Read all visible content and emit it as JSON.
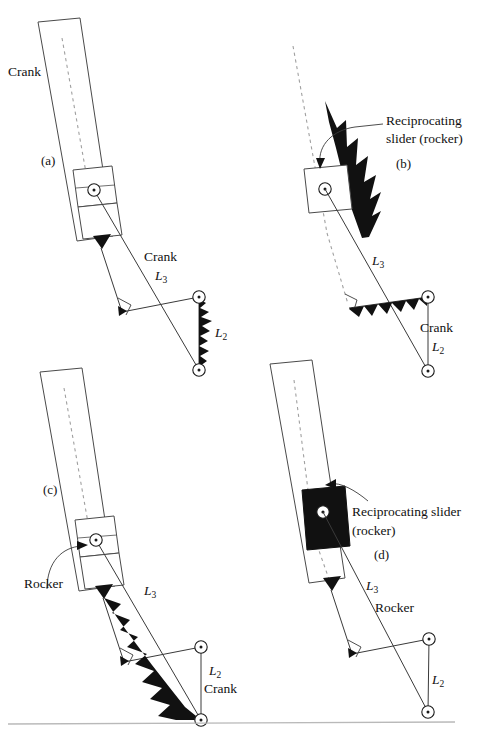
{
  "figure": {
    "type": "mechanism-inversion-diagram",
    "panel_count": 4,
    "divider_present": true,
    "colors": {
      "line": "#1a1a1a",
      "ground_hatch": "#111111",
      "dashed_axis": "#9a9a9a",
      "background": "#ffffff"
    }
  },
  "panels": [
    {
      "id": "a",
      "tag": "(a)",
      "labels": {
        "rocker_bar": "Crank",
        "coupler_name": "Crank",
        "coupler_length": "L",
        "coupler_sub": "3",
        "crank_length": "L",
        "crank_sub": "2"
      },
      "slider_fill": "white",
      "bar_outline": true
    },
    {
      "id": "b",
      "tag": "(b)",
      "labels": {
        "callout_line1": "Reciprocating",
        "callout_line2": "slider (rocker)",
        "coupler_length": "L",
        "coupler_sub": "3",
        "crank_name": "Crank",
        "crank_length": "L",
        "crank_sub": "2"
      },
      "slider_fill": "white",
      "bar_outline": false
    },
    {
      "id": "c",
      "tag": "(c)",
      "labels": {
        "callout": "Rocker",
        "coupler_length": "L",
        "coupler_sub": "3",
        "crank_length": "L",
        "crank_sub": "2",
        "crank_name": "Crank"
      },
      "slider_fill": "white",
      "bar_outline": true
    },
    {
      "id": "d",
      "tag": "(d)",
      "labels": {
        "callout_line1": "Reciprocating slider",
        "callout_line2": "(rocker)",
        "coupler_length": "L",
        "coupler_sub": "3",
        "coupler_name": "Rocker",
        "crank_length": "L",
        "crank_sub": "2"
      },
      "slider_fill": "black",
      "bar_outline": true
    }
  ]
}
